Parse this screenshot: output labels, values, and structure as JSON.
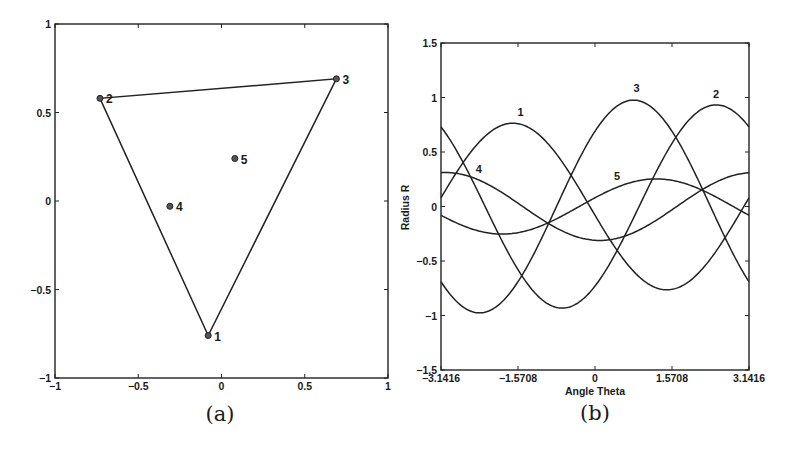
{
  "chart_data": [
    {
      "id": "a",
      "type": "scatter",
      "caption": "(a)",
      "title": "",
      "xlabel": "",
      "ylabel": "",
      "xlim": [
        -1,
        1
      ],
      "ylim": [
        -1,
        1
      ],
      "xticks": [
        -1,
        -0.5,
        0,
        0.5,
        1
      ],
      "xtick_labels": [
        "-1",
        "-0.5",
        "0",
        "0.5",
        "1"
      ],
      "yticks": [
        -1,
        -0.5,
        0,
        0.5,
        1
      ],
      "ytick_labels": [
        "-1",
        "-0.5",
        "0",
        "0.5",
        "1"
      ],
      "grid": false,
      "points": [
        {
          "label": "1",
          "x": -0.08,
          "y": -0.76
        },
        {
          "label": "2",
          "x": -0.73,
          "y": 0.58
        },
        {
          "label": "3",
          "x": 0.69,
          "y": 0.69
        },
        {
          "label": "4",
          "x": -0.31,
          "y": -0.03
        },
        {
          "label": "5",
          "x": 0.08,
          "y": 0.24
        }
      ],
      "polygon": [
        "1",
        "2",
        "3"
      ],
      "annotation": "Triangle connecting points 1, 2, 3 (convex hull); points 4 and 5 interior"
    },
    {
      "id": "b",
      "type": "line",
      "caption": "(b)",
      "title": "",
      "xlabel": "Angle Theta",
      "ylabel": "Radius R",
      "xlim": [
        -3.1416,
        3.1416
      ],
      "ylim": [
        -1.5,
        1.5
      ],
      "xticks": [
        -3.1416,
        -1.5708,
        0,
        1.5708,
        3.1416
      ],
      "xtick_labels": [
        "-3.1416",
        "-1.5708",
        "0",
        "1.5708",
        "3.1416"
      ],
      "yticks": [
        -1.5,
        -1,
        -0.5,
        0,
        0.5,
        1,
        1.5
      ],
      "ytick_labels": [
        "-1.5",
        "-1",
        "-0.5",
        "0",
        "0.5",
        "1",
        "1.5"
      ],
      "grid": false,
      "formula": "R = x*cos(Theta) + y*sin(Theta)",
      "series": [
        {
          "name": "1",
          "x": -0.08,
          "y": -0.76,
          "amplitude": 0.76,
          "peak_theta": -1.68,
          "value_at_minus_pi": 0.08,
          "label_pos": [
            -1.52,
            0.83
          ]
        },
        {
          "name": "2",
          "x": -0.73,
          "y": 0.58,
          "amplitude": 0.93,
          "peak_theta": 2.47,
          "value_at_minus_pi": 0.73,
          "label_pos": [
            2.47,
            1.0
          ]
        },
        {
          "name": "3",
          "x": 0.69,
          "y": 0.69,
          "amplitude": 0.98,
          "peak_theta": 0.79,
          "value_at_minus_pi": -0.69,
          "label_pos": [
            0.85,
            1.05
          ]
        },
        {
          "name": "4",
          "x": -0.31,
          "y": -0.03,
          "amplitude": 0.31,
          "peak_theta": -3.05,
          "value_at_minus_pi": 0.31,
          "label_pos": [
            -2.37,
            0.31
          ]
        },
        {
          "name": "5",
          "x": 0.08,
          "y": 0.24,
          "amplitude": 0.25,
          "peak_theta": 1.25,
          "value_at_minus_pi": -0.08,
          "label_pos": [
            0.45,
            0.24
          ]
        }
      ]
    }
  ],
  "figure": {
    "captions": [
      "(a)",
      "(b)"
    ],
    "line_color": "#222222",
    "background": "#ffffff"
  }
}
